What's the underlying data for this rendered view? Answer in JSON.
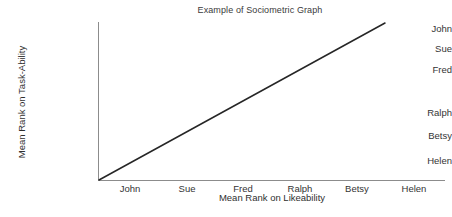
{
  "chart_data": {
    "type": "line",
    "title": "Example of Sociometric Graph",
    "xlabel": "Mean Rank on Likeability",
    "ylabel": "Mean Rank on Task-Ability",
    "x_tick_labels": [
      "John",
      "Sue",
      "Fred",
      "Ralph",
      "Betsy",
      "Helen"
    ],
    "y_tick_labels_top_to_bottom": [
      "John",
      "Sue",
      "Fred",
      "Ralph",
      "Betsy",
      "Helen"
    ],
    "grid": false,
    "legend": null,
    "series": [
      {
        "name": "Perfect rank correspondence",
        "points": [
          {
            "x": "Helen",
            "y": "Helen"
          },
          {
            "x": "Betsy",
            "y": "Betsy"
          },
          {
            "x": "Ralph",
            "y": "Ralph"
          },
          {
            "x": "Fred",
            "y": "Fred"
          },
          {
            "x": "Sue",
            "y": "Sue"
          },
          {
            "x": "John",
            "y": "John"
          }
        ],
        "color": "#262626"
      }
    ],
    "annotations": []
  },
  "axes": {
    "line_color": "#8c8c8c",
    "y_ticks": [
      {
        "label": "John",
        "y": 28
      },
      {
        "label": "Sue",
        "y": 48
      },
      {
        "label": "Fred",
        "y": 69
      },
      {
        "label": "Ralph",
        "y": 112
      },
      {
        "label": "Betsy",
        "y": 135
      },
      {
        "label": "Helen",
        "y": 160
      }
    ],
    "x_ticks": [
      {
        "label": "John",
        "x": 130
      },
      {
        "label": "Sue",
        "x": 187
      },
      {
        "label": "Fred",
        "x": 243
      },
      {
        "label": "Ralph",
        "x": 300
      },
      {
        "label": "Betsy",
        "x": 357
      },
      {
        "label": "Helen",
        "x": 414
      }
    ]
  }
}
